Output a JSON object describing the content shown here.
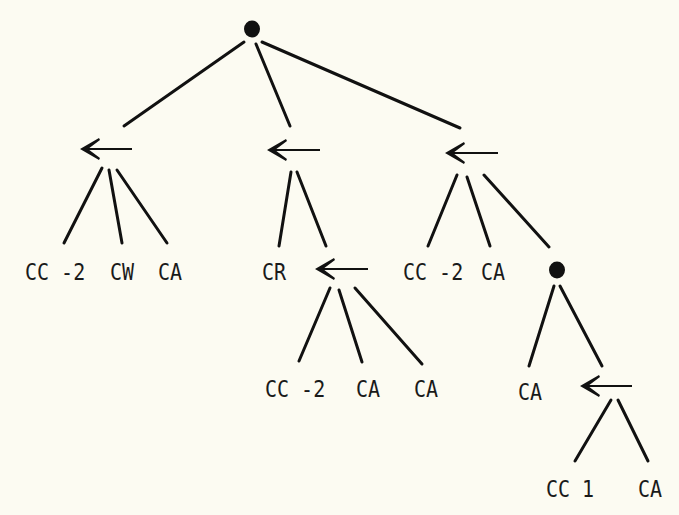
{
  "diagram": {
    "type": "tree",
    "background": "#fcfbf2",
    "ink": "#111111",
    "nodes": {
      "root": {
        "kind": "dot",
        "x": 252,
        "y": 29
      },
      "arrow_left": {
        "kind": "arrow",
        "x1": 80,
        "x2": 132,
        "y": 149
      },
      "arrow_mid": {
        "kind": "arrow",
        "x1": 267,
        "x2": 320,
        "y": 150
      },
      "arrow_right": {
        "kind": "arrow",
        "x1": 445,
        "x2": 498,
        "y": 153
      },
      "arrow_cr": {
        "kind": "arrow",
        "x1": 315,
        "x2": 368,
        "y": 269
      },
      "dot_right": {
        "kind": "dot",
        "x": 557,
        "y": 270
      },
      "arrow_bottom": {
        "kind": "arrow",
        "x1": 580,
        "x2": 632,
        "y": 386
      }
    },
    "labels": [
      {
        "id": "l1",
        "text": "CC -2",
        "x": 25,
        "y": 260
      },
      {
        "id": "l2",
        "text": "CW",
        "x": 110,
        "y": 260
      },
      {
        "id": "l3",
        "text": "CA",
        "x": 158,
        "y": 260
      },
      {
        "id": "l4",
        "text": "CR",
        "x": 262,
        "y": 260
      },
      {
        "id": "l5",
        "text": "CC -2",
        "x": 403,
        "y": 260
      },
      {
        "id": "l6",
        "text": "CA",
        "x": 481,
        "y": 260
      },
      {
        "id": "l7",
        "text": "CC -2",
        "x": 265,
        "y": 377
      },
      {
        "id": "l8",
        "text": "CA",
        "x": 356,
        "y": 377
      },
      {
        "id": "l9",
        "text": "CA",
        "x": 414,
        "y": 377
      },
      {
        "id": "l10",
        "text": "CA",
        "x": 518,
        "y": 380
      },
      {
        "id": "l11",
        "text": "CC 1",
        "x": 546,
        "y": 477
      },
      {
        "id": "l12",
        "text": "CA",
        "x": 638,
        "y": 477
      }
    ],
    "edges": [
      {
        "from": "root",
        "to": "arrow_left",
        "x1": 244,
        "y1": 42,
        "x2": 124,
        "y2": 126
      },
      {
        "from": "root",
        "to": "arrow_mid",
        "x1": 256,
        "y1": 44,
        "x2": 290,
        "y2": 126
      },
      {
        "from": "root",
        "to": "arrow_right",
        "x1": 262,
        "y1": 42,
        "x2": 460,
        "y2": 128
      },
      {
        "from": "arrow_left",
        "to": "CC -2",
        "x1": 102,
        "y1": 168,
        "x2": 64,
        "y2": 243
      },
      {
        "from": "arrow_left",
        "to": "CW",
        "x1": 109,
        "y1": 170,
        "x2": 122,
        "y2": 243
      },
      {
        "from": "arrow_left",
        "to": "CA",
        "x1": 117,
        "y1": 170,
        "x2": 167,
        "y2": 243
      },
      {
        "from": "arrow_mid",
        "to": "CR",
        "x1": 291,
        "y1": 172,
        "x2": 279,
        "y2": 246
      },
      {
        "from": "arrow_mid",
        "to": "arrow_cr",
        "x1": 297,
        "y1": 172,
        "x2": 326,
        "y2": 246
      },
      {
        "from": "arrow_right",
        "to": "CC -2",
        "x1": 457,
        "y1": 175,
        "x2": 428,
        "y2": 246
      },
      {
        "from": "arrow_right",
        "to": "CA",
        "x1": 467,
        "y1": 177,
        "x2": 490,
        "y2": 246
      },
      {
        "from": "arrow_right",
        "to": "dot_right",
        "x1": 484,
        "y1": 175,
        "x2": 549,
        "y2": 247
      },
      {
        "from": "arrow_cr",
        "to": "CC -2",
        "x1": 330,
        "y1": 288,
        "x2": 299,
        "y2": 361
      },
      {
        "from": "arrow_cr",
        "to": "CA",
        "x1": 339,
        "y1": 290,
        "x2": 362,
        "y2": 362
      },
      {
        "from": "arrow_cr",
        "to": "CA",
        "x1": 355,
        "y1": 288,
        "x2": 422,
        "y2": 364
      },
      {
        "from": "dot_right",
        "to": "CA",
        "x1": 554,
        "y1": 286,
        "x2": 529,
        "y2": 366
      },
      {
        "from": "dot_right",
        "to": "arrow_bottom",
        "x1": 560,
        "y1": 286,
        "x2": 602,
        "y2": 366
      },
      {
        "from": "arrow_bottom",
        "to": "CC 1",
        "x1": 611,
        "y1": 400,
        "x2": 575,
        "y2": 461
      },
      {
        "from": "arrow_bottom",
        "to": "CA",
        "x1": 618,
        "y1": 400,
        "x2": 648,
        "y2": 461
      }
    ]
  }
}
